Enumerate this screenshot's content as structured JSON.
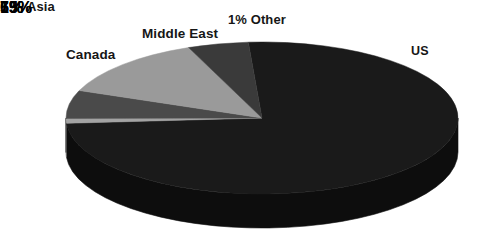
{
  "chart_data": {
    "type": "pie",
    "title": "",
    "subtitle": "",
    "xlabel": "",
    "ylabel": "",
    "legend_position": "none",
    "grid": false,
    "three_d": true,
    "background_color": "#ffffff",
    "categories": [
      "US",
      "Other",
      "Middle East",
      "Canada",
      "Asia"
    ],
    "values": [
      75,
      1,
      6,
      13,
      5
    ],
    "unit": "%",
    "slices": [
      {
        "name": "US",
        "value": 75,
        "value_label": "75%",
        "category_label": "US",
        "color": "#1a1a1a",
        "side_color": "#0d0d0d",
        "value_label_color": "#ffffff",
        "value_label_inside": true
      },
      {
        "name": "Other",
        "value": 1,
        "value_label": "1%",
        "category_label": "1% Other",
        "color": "#a3a3a3",
        "side_color": "#6e6e6e",
        "value_label_color": "#161616",
        "value_label_inside": false
      },
      {
        "name": "Middle East",
        "value": 6,
        "value_label": "6%",
        "category_label": "Middle East",
        "color": "#4a4a4a",
        "side_color": "#2e2e2e",
        "value_label_color": "#ffffff",
        "value_label_inside": true
      },
      {
        "name": "Canada",
        "value": 13,
        "value_label": "13%",
        "category_label": "Canada",
        "color": "#9a9a9a",
        "side_color": "#676767",
        "value_label_color": "#111111",
        "value_label_inside": true
      },
      {
        "name": "Asia",
        "value": 5,
        "value_label": "5%",
        "category_label": "Asia",
        "color": "#3a3a3a",
        "side_color": "#242424",
        "value_label_color": "#ffffff",
        "value_label_inside": true
      }
    ]
  }
}
